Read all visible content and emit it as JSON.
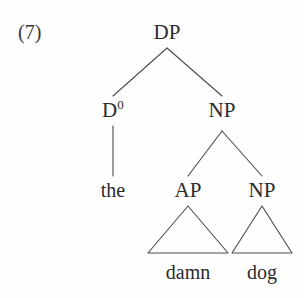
{
  "figure": {
    "example_number": "(7)",
    "caption": "",
    "ink_color": "#2b2b2b",
    "background_color": "#fefefe"
  },
  "tree": {
    "root": {
      "label": "DP",
      "x": 167,
      "y": 32
    },
    "level2": [
      {
        "label_base": "D",
        "label_superscript": "0",
        "label": "D0",
        "x": 113,
        "y": 110
      },
      {
        "label_base": "NP",
        "label_superscript": "",
        "label": "NP",
        "x": 222,
        "y": 110
      }
    ],
    "level3": [
      {
        "label": "the",
        "x": 113,
        "y": 190,
        "type": "terminal"
      },
      {
        "label": "AP",
        "x": 188,
        "y": 190,
        "type": "phrase"
      },
      {
        "label": "NP",
        "x": 262,
        "y": 190,
        "type": "phrase"
      }
    ],
    "leaves": [
      {
        "label": "damn",
        "x": 188,
        "y": 272
      },
      {
        "label": "dog",
        "x": 262,
        "y": 272
      }
    ]
  },
  "edges": {
    "dp_to_d0": {
      "x1": 167,
      "y1": 48,
      "x2": 113,
      "y2": 96
    },
    "dp_to_np": {
      "x1": 167,
      "y1": 48,
      "x2": 222,
      "y2": 96
    },
    "d0_to_the": {
      "x1": 113,
      "y1": 126,
      "x2": 113,
      "y2": 176
    },
    "np_to_ap": {
      "x1": 222,
      "y1": 131,
      "x2": 188,
      "y2": 176
    },
    "np_to_np": {
      "x1": 222,
      "y1": 131,
      "x2": 262,
      "y2": 176
    }
  },
  "triangles": [
    {
      "name": "ap-triangle",
      "apex_x": 188,
      "apex_y": 206,
      "left_x": 148,
      "right_x": 228,
      "base_y": 253
    },
    {
      "name": "np-triangle",
      "apex_x": 262,
      "apex_y": 206,
      "left_x": 232,
      "right_x": 292,
      "base_y": 253
    }
  ],
  "style": {
    "stroke_width": 1.1
  }
}
